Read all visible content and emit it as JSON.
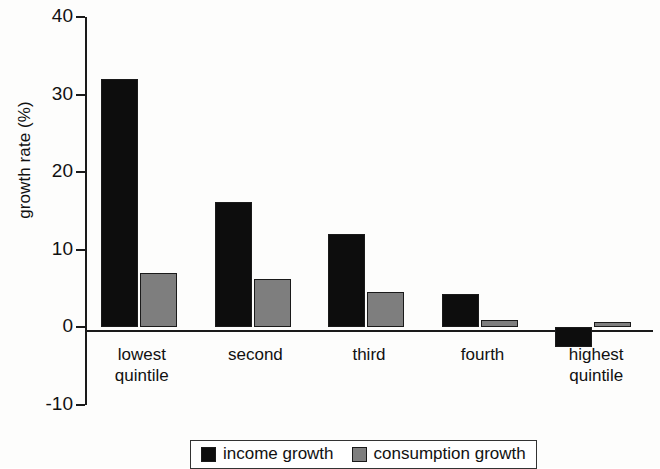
{
  "chart_data": {
    "type": "bar",
    "title": "",
    "xlabel": "",
    "ylabel": "growth rate (%)",
    "ylim": [
      -10,
      40
    ],
    "yticks": [
      40,
      30,
      20,
      10,
      0,
      -10
    ],
    "ytick_labels": [
      "40",
      "30",
      "20",
      "10",
      "0",
      "-10"
    ],
    "grid": false,
    "legend_position": "bottom",
    "categories": [
      "lowest\nquintile",
      "second",
      "third",
      "fourth",
      "highest\nquintile"
    ],
    "series": [
      {
        "name": "income growth",
        "color": "#0d0d0d",
        "values": [
          32.0,
          16.2,
          12.0,
          4.3,
          -2.5
        ]
      },
      {
        "name": "consumption growth",
        "color": "#7e7e7e",
        "values": [
          7.0,
          6.3,
          4.6,
          1.0,
          0.7
        ]
      }
    ]
  }
}
